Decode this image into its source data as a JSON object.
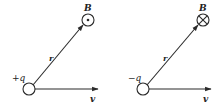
{
  "diagrams": [
    {
      "charge_label": "+q",
      "field_label": "B",
      "position_label": "r",
      "velocity_label": "v",
      "field_direction": "out-of-page",
      "field_symbol": "dot"
    },
    {
      "charge_label": "−q",
      "field_label": "B",
      "position_label": "r",
      "velocity_label": "v",
      "field_direction": "into-page",
      "field_symbol": "cross"
    }
  ],
  "colors": {
    "stroke": "#2a2a2a",
    "background": "#ffffff"
  }
}
